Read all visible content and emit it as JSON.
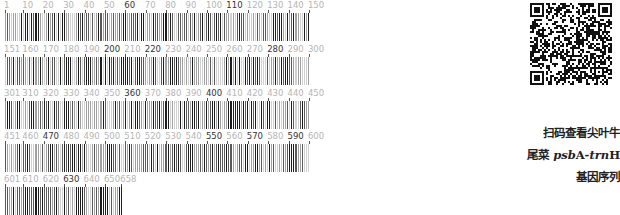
{
  "figure": {
    "type": "DNA barcode",
    "gene": "psbA-trnH",
    "sequence_length": 658,
    "bases_per_row": 150,
    "colors": {
      "A": "#1e1e1e",
      "T": "#5a5a5a",
      "C": "#a0a0a0",
      "G": "#d0d0d0",
      "label_dark": "#333333",
      "label_light": "#b5b5b5"
    }
  },
  "rows": [
    {
      "start": 1,
      "end": 150,
      "ticks": [
        {
          "pos": 1,
          "label": "1",
          "dark": false
        },
        {
          "pos": 10,
          "label": "10",
          "dark": false
        },
        {
          "pos": 20,
          "label": "20",
          "dark": false
        },
        {
          "pos": 30,
          "label": "30",
          "dark": false
        },
        {
          "pos": 40,
          "label": "40",
          "dark": false
        },
        {
          "pos": 50,
          "label": "50",
          "dark": false
        },
        {
          "pos": 60,
          "label": "60",
          "dark": true
        },
        {
          "pos": 70,
          "label": "70",
          "dark": false
        },
        {
          "pos": 80,
          "label": "80",
          "dark": false
        },
        {
          "pos": 90,
          "label": "90",
          "dark": false
        },
        {
          "pos": 100,
          "label": "100",
          "dark": false
        },
        {
          "pos": 110,
          "label": "110",
          "dark": true
        },
        {
          "pos": 120,
          "label": "120",
          "dark": false
        },
        {
          "pos": 130,
          "label": "130",
          "dark": false
        },
        {
          "pos": 140,
          "label": "140",
          "dark": false
        },
        {
          "pos": 150,
          "label": "150",
          "dark": false
        }
      ]
    },
    {
      "start": 151,
      "end": 300,
      "ticks": [
        {
          "pos": 151,
          "label": "151",
          "dark": false
        },
        {
          "pos": 160,
          "label": "160",
          "dark": false
        },
        {
          "pos": 170,
          "label": "170",
          "dark": false
        },
        {
          "pos": 180,
          "label": "180",
          "dark": false
        },
        {
          "pos": 190,
          "label": "190",
          "dark": false
        },
        {
          "pos": 200,
          "label": "200",
          "dark": true
        },
        {
          "pos": 210,
          "label": "210",
          "dark": false
        },
        {
          "pos": 220,
          "label": "220",
          "dark": true
        },
        {
          "pos": 230,
          "label": "230",
          "dark": false
        },
        {
          "pos": 240,
          "label": "240",
          "dark": false
        },
        {
          "pos": 250,
          "label": "250",
          "dark": false
        },
        {
          "pos": 260,
          "label": "260",
          "dark": false
        },
        {
          "pos": 270,
          "label": "270",
          "dark": false
        },
        {
          "pos": 280,
          "label": "280",
          "dark": true
        },
        {
          "pos": 290,
          "label": "290",
          "dark": false
        },
        {
          "pos": 300,
          "label": "300",
          "dark": false
        }
      ]
    },
    {
      "start": 301,
      "end": 450,
      "ticks": [
        {
          "pos": 301,
          "label": "301",
          "dark": false
        },
        {
          "pos": 310,
          "label": "310",
          "dark": false
        },
        {
          "pos": 320,
          "label": "320",
          "dark": false
        },
        {
          "pos": 330,
          "label": "330",
          "dark": false
        },
        {
          "pos": 340,
          "label": "340",
          "dark": false
        },
        {
          "pos": 350,
          "label": "350",
          "dark": false
        },
        {
          "pos": 360,
          "label": "360",
          "dark": true
        },
        {
          "pos": 370,
          "label": "370",
          "dark": false
        },
        {
          "pos": 380,
          "label": "380",
          "dark": false
        },
        {
          "pos": 390,
          "label": "390",
          "dark": false
        },
        {
          "pos": 400,
          "label": "400",
          "dark": true
        },
        {
          "pos": 410,
          "label": "410",
          "dark": false
        },
        {
          "pos": 420,
          "label": "420",
          "dark": false
        },
        {
          "pos": 430,
          "label": "430",
          "dark": false
        },
        {
          "pos": 440,
          "label": "440",
          "dark": false
        },
        {
          "pos": 450,
          "label": "450",
          "dark": false
        }
      ]
    },
    {
      "start": 451,
      "end": 600,
      "ticks": [
        {
          "pos": 451,
          "label": "451",
          "dark": false
        },
        {
          "pos": 460,
          "label": "460",
          "dark": false
        },
        {
          "pos": 470,
          "label": "470",
          "dark": true
        },
        {
          "pos": 480,
          "label": "480",
          "dark": false
        },
        {
          "pos": 490,
          "label": "490",
          "dark": false
        },
        {
          "pos": 500,
          "label": "500",
          "dark": false
        },
        {
          "pos": 510,
          "label": "510",
          "dark": false
        },
        {
          "pos": 520,
          "label": "520",
          "dark": false
        },
        {
          "pos": 530,
          "label": "530",
          "dark": false
        },
        {
          "pos": 540,
          "label": "540",
          "dark": false
        },
        {
          "pos": 550,
          "label": "550",
          "dark": true
        },
        {
          "pos": 560,
          "label": "560",
          "dark": false
        },
        {
          "pos": 570,
          "label": "570",
          "dark": true
        },
        {
          "pos": 580,
          "label": "580",
          "dark": false
        },
        {
          "pos": 590,
          "label": "590",
          "dark": true
        },
        {
          "pos": 600,
          "label": "600",
          "dark": false
        }
      ]
    },
    {
      "start": 601,
      "end": 658,
      "ticks": [
        {
          "pos": 601,
          "label": "601",
          "dark": false
        },
        {
          "pos": 610,
          "label": "610",
          "dark": false
        },
        {
          "pos": 620,
          "label": "620",
          "dark": false
        },
        {
          "pos": 630,
          "label": "630",
          "dark": true
        },
        {
          "pos": 640,
          "label": "640",
          "dark": false
        },
        {
          "pos": 650,
          "label": "650",
          "dark": false
        },
        {
          "pos": 658,
          "label": "658",
          "dark": false
        }
      ]
    }
  ],
  "caption": {
    "line1": "扫码查看尖叶牛",
    "line2_prefix": "尾菜 ",
    "line2_gene_italic": "psb",
    "line2_gene_mid": "A-",
    "line2_gene_italic2": "trn",
    "line2_gene_end": "H",
    "line3": "基因序列"
  },
  "qr_code": {
    "label": "qr-code"
  }
}
